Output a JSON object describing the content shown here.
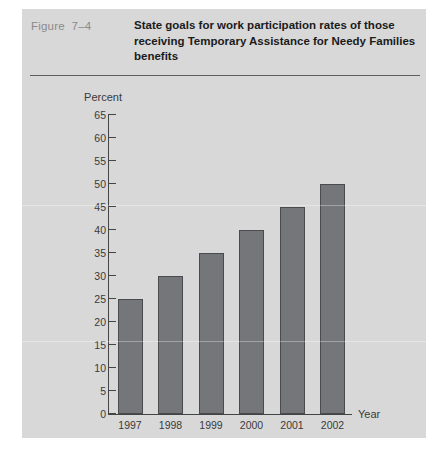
{
  "figure": {
    "number": "Figure  7–4",
    "title": "State goals for work participation rates of those receiving Temporary Assistance for Needy Families benefits"
  },
  "chart_data": {
    "type": "bar",
    "title": "State goals for work participation rates of those receiving Temporary Assistance for Needy Families benefits",
    "categories": [
      "1997",
      "1998",
      "1999",
      "2000",
      "2001",
      "2002"
    ],
    "values": [
      25,
      30,
      35,
      40,
      45,
      50
    ],
    "xlabel": "Year",
    "ylabel": "Percent",
    "ylim": [
      0,
      65
    ],
    "ytick_step": 5,
    "yticks": [
      "65",
      "60",
      "55",
      "50",
      "45",
      "40",
      "35",
      "30",
      "25",
      "20",
      "15",
      "10",
      "5",
      "0"
    ],
    "grid": false,
    "legend": false,
    "bar_color": "#75767a",
    "bar_edge_color": "#4a4b4e",
    "background_color": "#d8d8d8",
    "axis_color": "#444444",
    "text_color": "#3a3a3a"
  }
}
